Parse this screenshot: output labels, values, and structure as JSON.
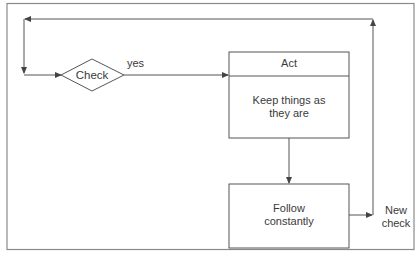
{
  "diagram": {
    "nodes": {
      "check": {
        "label": "Check",
        "shape": "diamond"
      },
      "act": {
        "header": "Act",
        "body": "Keep things as they are",
        "body_line1": "Keep things as",
        "body_line2": "they are"
      },
      "follow": {
        "label": "Follow constantly",
        "line1": "Follow",
        "line2": "constantly"
      },
      "new_check": {
        "label": "New check",
        "line1": "New",
        "line2": "check"
      }
    },
    "edge_labels": {
      "yes": "yes"
    },
    "edges": [
      {
        "from": "check",
        "to": "act",
        "label": "yes"
      },
      {
        "from": "act",
        "to": "follow"
      },
      {
        "from": "follow",
        "to": "new_check"
      },
      {
        "from": "new_check",
        "to": "check",
        "via": "top loop"
      }
    ],
    "colors": {
      "line": "#555555",
      "frame": "#888888",
      "text": "#3a3a3a"
    }
  }
}
